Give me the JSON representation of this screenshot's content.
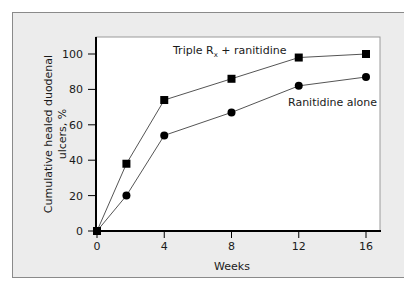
{
  "chart_data": {
    "type": "line",
    "title": "",
    "xlabel": "Weeks",
    "ylabel_lines": [
      "Cumulative healed duodenal",
      "ulcers, %"
    ],
    "ylabel": "Cumulative healed duodenal ulcers, %",
    "xlim": [
      0,
      16
    ],
    "ylim": [
      0,
      100
    ],
    "xticks": [
      0,
      4,
      8,
      12,
      16
    ],
    "yticks": [
      0,
      20,
      40,
      60,
      80,
      100
    ],
    "grid": false,
    "legend_position": "inline annotations",
    "series": [
      {
        "name": "Triple Rx + ranitidine",
        "label_main": "Triple R",
        "label_sub": "x",
        "label_rest": " + ranitidine",
        "marker": "square",
        "x": [
          0,
          1.75,
          4,
          8,
          12,
          16
        ],
        "values": [
          0,
          38,
          74,
          86,
          98,
          100
        ]
      },
      {
        "name": "Ranitidine alone",
        "marker": "circle",
        "x": [
          0,
          1.75,
          4,
          8,
          12,
          16
        ],
        "values": [
          0,
          20,
          54,
          67,
          82,
          87
        ]
      }
    ]
  },
  "colors": {
    "frame_bg": "#ececec",
    "plot_bg": "#ffffff",
    "line": "#555555",
    "marker": "#000000",
    "axis": "#000000"
  }
}
